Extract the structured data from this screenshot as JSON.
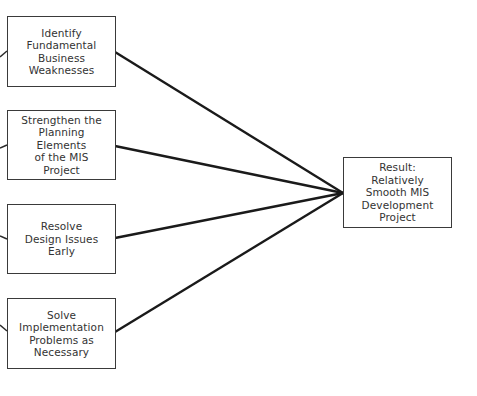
{
  "diagram": {
    "inputs": [
      {
        "id": "identify",
        "label": "Identify\nFundamental\nBusiness\nWeaknesses"
      },
      {
        "id": "strengthen",
        "label": "Strengthen the\nPlanning\nElements\nof the MIS\nProject"
      },
      {
        "id": "resolve",
        "label": "Resolve\nDesign Issues\nEarly"
      },
      {
        "id": "solve",
        "label": "Solve\nImplementation\nProblems as\nNecessary"
      }
    ],
    "result": {
      "label": "Result:\nRelatively\nSmooth MIS\nDevelopment\nProject"
    },
    "colors": {
      "line": "#1a1a1a",
      "border": "#3a3a3a",
      "text": "#333333"
    }
  }
}
